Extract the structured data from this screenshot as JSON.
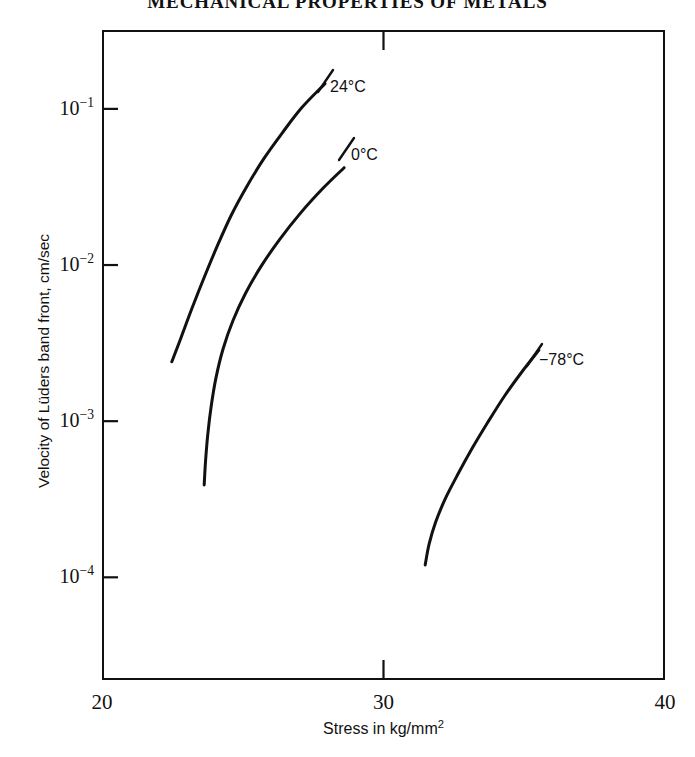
{
  "page": {
    "running_head": "MECHANICAL PROPERTIES OF METALS"
  },
  "chart_data": {
    "type": "line",
    "title": "",
    "xlabel": "Stress in kg/mm",
    "xlabel_exponent": "2",
    "ylabel": "Velocity of Lüders band front, cm/sec",
    "xlim": [
      20,
      40
    ],
    "ylim": [
      2.2e-05,
      0.32
    ],
    "yscale": "log",
    "xscale": "linear",
    "grid": false,
    "legend_position": "inline-annotations",
    "xticks": [
      {
        "value": 20,
        "label": "20"
      },
      {
        "value": 30,
        "label": "30"
      },
      {
        "value": 40,
        "label": "40"
      }
    ],
    "yticks": [
      {
        "value": 0.1,
        "mantissa": "10",
        "exponent": "−1"
      },
      {
        "value": 0.01,
        "mantissa": "10",
        "exponent": "−2"
      },
      {
        "value": 0.001,
        "mantissa": "10",
        "exponent": "−3"
      },
      {
        "value": 0.0001,
        "mantissa": "10",
        "exponent": "−4"
      }
    ],
    "series": [
      {
        "name": "24°C",
        "label": "24°C",
        "color": "#111111",
        "points": [
          {
            "x": 22.48,
            "y": 0.0024
          },
          {
            "x": 22.8,
            "y": 0.0034
          },
          {
            "x": 23.2,
            "y": 0.0053
          },
          {
            "x": 23.65,
            "y": 0.0085
          },
          {
            "x": 24.1,
            "y": 0.0133
          },
          {
            "x": 24.6,
            "y": 0.021
          },
          {
            "x": 25.15,
            "y": 0.032
          },
          {
            "x": 25.75,
            "y": 0.048
          },
          {
            "x": 26.4,
            "y": 0.07
          },
          {
            "x": 27.1,
            "y": 0.102
          },
          {
            "x": 27.92,
            "y": 0.145
          }
        ]
      },
      {
        "name": "0°C",
        "label": "0°C",
        "color": "#111111",
        "points": [
          {
            "x": 23.63,
            "y": 0.00039
          },
          {
            "x": 23.68,
            "y": 0.00056
          },
          {
            "x": 23.76,
            "y": 0.00083
          },
          {
            "x": 23.88,
            "y": 0.00125
          },
          {
            "x": 24.05,
            "y": 0.0019
          },
          {
            "x": 24.3,
            "y": 0.0029
          },
          {
            "x": 24.65,
            "y": 0.0044
          },
          {
            "x": 25.1,
            "y": 0.0066
          },
          {
            "x": 25.65,
            "y": 0.0098
          },
          {
            "x": 26.3,
            "y": 0.0145
          },
          {
            "x": 27.05,
            "y": 0.0215
          },
          {
            "x": 27.85,
            "y": 0.031
          },
          {
            "x": 28.6,
            "y": 0.042
          }
        ]
      },
      {
        "name": "−78°C",
        "label": "−78°C",
        "color": "#111111",
        "points": [
          {
            "x": 31.48,
            "y": 0.00012
          },
          {
            "x": 31.62,
            "y": 0.000163
          },
          {
            "x": 31.85,
            "y": 0.000225
          },
          {
            "x": 32.2,
            "y": 0.00032
          },
          {
            "x": 32.65,
            "y": 0.00046
          },
          {
            "x": 33.15,
            "y": 0.00067
          },
          {
            "x": 33.7,
            "y": 0.00098
          },
          {
            "x": 34.3,
            "y": 0.00145
          },
          {
            "x": 34.9,
            "y": 0.00205
          },
          {
            "x": 35.52,
            "y": 0.00285
          }
        ]
      }
    ],
    "annotations": [
      {
        "text": "24°C",
        "attached_to": "24°C"
      },
      {
        "text": "0°C",
        "attached_to": "0°C"
      },
      {
        "text": "−78°C",
        "attached_to": "−78°C"
      }
    ]
  }
}
